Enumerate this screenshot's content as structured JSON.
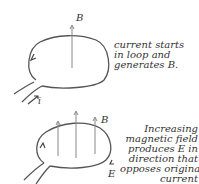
{
  "panel1": {
    "field_label": "B",
    "current_label": "i",
    "caption_lines": [
      "current starts",
      "in loop and",
      "generates B."
    ]
  },
  "panel2": {
    "field_label": "B",
    "emf_label": "E",
    "caption_lines": [
      "Increasing",
      "magnetic field",
      "produces E in",
      "direction that",
      "opposes original",
      "current"
    ]
  },
  "colors": {
    "ink": "#444444",
    "arrow": "#777777",
    "background": "#ffffff"
  }
}
